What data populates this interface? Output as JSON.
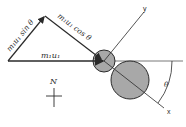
{
  "diagram": {
    "labels": {
      "momentum_initial": "m₁u₁",
      "component_sin": "m₁u₁ sin θ",
      "component_cos": "m₁u₁ cos θ",
      "axis_x": "x",
      "axis_y": "y",
      "angle": "θ",
      "north": "N"
    },
    "colors": {
      "line": "#2a2a2a",
      "ball_fill": "#a8a8a8",
      "background": "#ffffff"
    },
    "bodies": [
      {
        "name": "small-ball",
        "cx": 104,
        "cy": 61,
        "r": 11
      },
      {
        "name": "large-ball",
        "cx": 130,
        "cy": 80,
        "r": 19
      }
    ]
  }
}
